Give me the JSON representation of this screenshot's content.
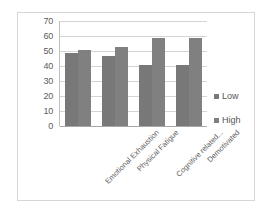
{
  "chart_data": {
    "type": "bar",
    "title": "",
    "subtitle": "",
    "xlabel": "",
    "ylabel": "",
    "categories": [
      "Emotional Exhaustion",
      "Physical Fatigue",
      "Cognitive related...",
      "Demotivated"
    ],
    "series": [
      {
        "name": "Low",
        "values": [
          49,
          47,
          41,
          41
        ],
        "color": "#787878"
      },
      {
        "name": "High",
        "values": [
          51,
          53,
          59,
          59
        ],
        "color": "#808080"
      }
    ],
    "ylim": [
      0,
      70
    ],
    "ytick_values": [
      70,
      60,
      50,
      40,
      30,
      20,
      10,
      0
    ],
    "ytick_labels": [
      "70",
      "60",
      "50",
      "40",
      "30",
      "20",
      "10",
      "0"
    ],
    "grid": true,
    "grid_orientation": "horizontal",
    "legend_position": "right",
    "legend_entries": [
      "Low",
      "High"
    ],
    "bar_orientation": "vertical",
    "xtick_rotation": -45
  },
  "frame": {
    "border_color": "#d6d6d6",
    "background": "#ffffff"
  }
}
